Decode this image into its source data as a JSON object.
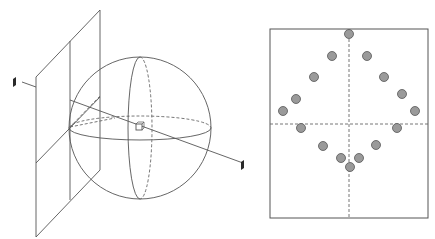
{
  "colors": {
    "stroke": "#555555",
    "dashed": "#666666",
    "dot_fill": "#9a9a9a",
    "dot_stroke": "#555555",
    "sensor_fill": "#2a2a2a",
    "background": "#ffffff"
  },
  "left_figure": {
    "plane": [
      [
        36,
        77
      ],
      [
        100,
        10
      ],
      [
        100,
        170
      ],
      [
        36,
        237
      ]
    ],
    "plane_vline": [
      [
        70,
        41
      ],
      [
        70,
        200
      ]
    ],
    "plane_hline": [
      [
        36,
        163
      ],
      [
        100,
        97
      ]
    ],
    "sphere": {
      "cx": 140,
      "cy": 128,
      "r": 71
    },
    "equator": {
      "cx": 140,
      "cy": 128,
      "rx": 71,
      "ry": 12
    },
    "meridian": {
      "cx": 140,
      "cy": 128,
      "rx": 12,
      "ry": 71
    },
    "ray": [
      [
        70,
        100
      ],
      [
        243,
        163
      ]
    ],
    "center_box": {
      "x": 136,
      "y": 124,
      "size": 6
    },
    "left_sensor": {
      "x": 13,
      "y": 77
    },
    "right_sensor": {
      "x": 241,
      "y": 160
    }
  },
  "right_figure": {
    "frame": {
      "x": 270,
      "y": 29,
      "w": 158,
      "h": 189
    },
    "axis_x": 349,
    "axis_y": 124,
    "dots": [
      [
        349,
        34
      ],
      [
        332,
        56
      ],
      [
        367,
        56
      ],
      [
        314,
        77
      ],
      [
        384,
        77
      ],
      [
        296,
        99
      ],
      [
        402,
        94
      ],
      [
        283,
        111
      ],
      [
        415,
        111
      ],
      [
        301,
        128
      ],
      [
        397,
        128
      ],
      [
        323,
        146
      ],
      [
        376,
        145
      ],
      [
        341,
        158
      ],
      [
        359,
        158
      ],
      [
        350,
        167
      ]
    ],
    "dot_radius": 4.5
  }
}
